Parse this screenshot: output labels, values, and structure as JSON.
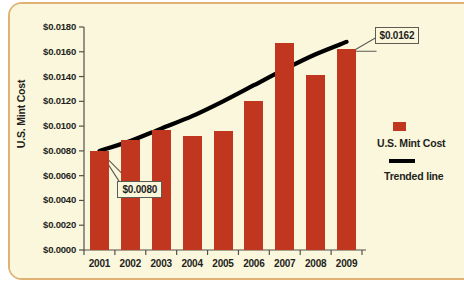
{
  "chart_data": {
    "type": "bar",
    "title": "",
    "subtitle": "",
    "xlabel": "",
    "ylabel": "U.S. Mint Cost",
    "categories": [
      "2001",
      "2002",
      "2003",
      "2004",
      "2005",
      "2006",
      "2007",
      "2008",
      "2009"
    ],
    "values": [
      0.008,
      0.0089,
      0.0097,
      0.0092,
      0.0096,
      0.012,
      0.0167,
      0.0141,
      0.0162
    ],
    "series": [
      {
        "name": "U.S. Mint Cost",
        "type": "bar",
        "color": "#c0361f",
        "values": [
          0.008,
          0.0089,
          0.0097,
          0.0092,
          0.0096,
          0.012,
          0.0167,
          0.0141,
          0.0162
        ]
      },
      {
        "name": "Trended line",
        "type": "line",
        "color": "#000000",
        "values": [
          0.008,
          0.0088,
          0.0098,
          0.0108,
          0.012,
          0.0133,
          0.0146,
          0.0158,
          0.0168
        ]
      }
    ],
    "ylim": [
      0.0,
      0.018
    ],
    "ytick_values": [
      0.0,
      0.002,
      0.004,
      0.006,
      0.008,
      0.01,
      0.012,
      0.014,
      0.016,
      0.018
    ],
    "ytick_labels": [
      "$0.0000",
      "$0.0020",
      "$0.0040",
      "$0.0060",
      "$0.0080",
      "$0.0100",
      "$0.0120",
      "$0.0140",
      "$0.0160",
      "$0.0180"
    ],
    "xtick_labels": [
      "2001",
      "2002",
      "2003",
      "2004",
      "2005",
      "2006",
      "2007",
      "2008",
      "2009"
    ],
    "grid": false,
    "legend_position": "right",
    "legend": [
      {
        "label": "U.S. Mint Cost",
        "marker": "square",
        "color": "#c0361f"
      },
      {
        "label": "Trended line",
        "marker": "line",
        "color": "#000000"
      }
    ],
    "annotations": [
      {
        "text": "$0.0080",
        "points_to": "2001",
        "value": 0.008
      },
      {
        "text": "$0.0162",
        "points_to": "2009",
        "value": 0.0162
      }
    ]
  },
  "panel": {
    "background_color": "#fbf7dd",
    "border_color": "#e0b172"
  }
}
